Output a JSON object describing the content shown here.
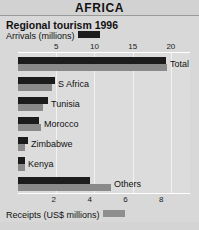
{
  "header": {
    "title": "AFRICA"
  },
  "chart_title": "Regional tourism 1996",
  "legend": {
    "top": {
      "label": "Arrivals (millions)",
      "swatch_name": "arrivals-swatch",
      "color": "#1c1c1c"
    },
    "bottom": {
      "label": "Receipts (US$ millions)",
      "swatch_name": "receipts-swatch",
      "color": "#8a8a8a"
    }
  },
  "chart_data": {
    "type": "bar",
    "orientation": "horizontal",
    "title": "Regional tourism 1996",
    "subtitle": "AFRICA",
    "categories": [
      "Total",
      "S Africa",
      "Tunisia",
      "Morocco",
      "Zimbabwe",
      "Kenya",
      "Others"
    ],
    "series": [
      {
        "name": "Arrivals (millions)",
        "color": "#1c1c1c",
        "axis": "top",
        "values": [
          19.4,
          4.9,
          3.9,
          2.7,
          1.3,
          0.9,
          9.4
        ]
      },
      {
        "name": "Receipts (US$ millions)",
        "color": "#8a8a8a",
        "axis": "bottom",
        "values": [
          8.3,
          1.9,
          1.4,
          1.3,
          0.4,
          0.4,
          5.2
        ]
      }
    ],
    "top_axis": {
      "label": "Arrivals (millions)",
      "ticks": [
        5,
        10,
        15,
        20
      ],
      "range": [
        0,
        22.5
      ],
      "tick_labels": [
        "5",
        "10",
        "15",
        "20"
      ]
    },
    "bottom_axis": {
      "label": "Receipts (US$ millions)",
      "ticks": [
        2,
        4,
        6,
        8
      ],
      "range": [
        0,
        9.6
      ],
      "tick_labels": [
        "2",
        "4",
        "6",
        "8"
      ]
    },
    "grid": true,
    "legend_position": "top and bottom"
  }
}
